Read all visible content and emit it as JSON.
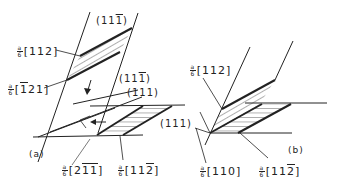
{
  "figure": {
    "panel_a": {
      "label": "(a)",
      "planes": [
        {
          "id": "plane_11-1_top",
          "text_pre": "(11",
          "bar": "1",
          "text_post": ")"
        },
        {
          "id": "plane_11-1_mid",
          "text_pre": "(11",
          "bar": "1",
          "text_post": ")"
        },
        {
          "id": "plane_111_mid",
          "text": "(111)"
        },
        {
          "id": "plane_111_right",
          "text": "(111)"
        }
      ],
      "vectors": [
        {
          "id": "vec_112",
          "num": "a",
          "den": "6",
          "pre": "[112]",
          "bar": "",
          "post": ""
        },
        {
          "id": "vec_-121",
          "num": "a",
          "den": "6",
          "pre": "[",
          "bar": "1",
          "post": "21]"
        },
        {
          "id": "vec_2-1-1",
          "num": "a",
          "den": "6",
          "pre": "[2",
          "bar": "11",
          "post": "]"
        },
        {
          "id": "vec_11-2",
          "num": "a",
          "den": "6",
          "pre": "[11",
          "bar": "2",
          "post": "]"
        }
      ]
    },
    "panel_b": {
      "label": "(b)",
      "vectors": [
        {
          "id": "vec_112",
          "num": "a",
          "den": "6",
          "pre": "[112]",
          "bar": "",
          "post": ""
        },
        {
          "id": "vec_110",
          "num": "a",
          "den": "6",
          "pre": "[110]",
          "bar": "",
          "post": ""
        },
        {
          "id": "vec_11-2",
          "num": "a",
          "den": "6",
          "pre": "[11",
          "bar": "2",
          "post": "]"
        }
      ]
    },
    "colors": {
      "ink": "#222222",
      "background": "#ffffff"
    }
  }
}
